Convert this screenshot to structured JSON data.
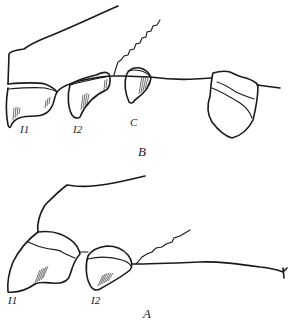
{
  "figure": {
    "panels": [
      {
        "id": "B",
        "label": "B",
        "teeth": [
          {
            "label": "I1"
          },
          {
            "label": "I2"
          },
          {
            "label": "C"
          }
        ]
      },
      {
        "id": "A",
        "label": "A",
        "teeth": [
          {
            "label": "I1"
          },
          {
            "label": "I2"
          }
        ]
      }
    ],
    "colors": {
      "ink": "#1a1a1a",
      "background": "#ffffff"
    }
  }
}
